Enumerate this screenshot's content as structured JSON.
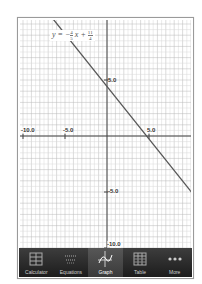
{
  "graph": {
    "equation": {
      "lhs": "y =",
      "sign": "−",
      "slope_num": "4",
      "slope_den": "5",
      "var": "x",
      "plus": "+",
      "intercept_num": "11",
      "intercept_den": "4"
    },
    "x_labels": [
      {
        "text": "-10.0",
        "value": -10
      },
      {
        "text": "-5.0",
        "value": -5
      },
      {
        "text": "5.0",
        "value": 5
      }
    ],
    "y_labels": [
      {
        "text": "5.0",
        "value": 5
      },
      {
        "text": "-5.0",
        "value": -5
      },
      {
        "text": "-10.0",
        "value": -10
      }
    ],
    "colors": {
      "line": "#555555",
      "grid_minor": "#d8d8d8",
      "grid_major": "#b8b8b8",
      "axis": "#444444"
    }
  },
  "tabbar": {
    "tabs": [
      {
        "label": "Calculator",
        "icon": "calculator-icon",
        "active": false
      },
      {
        "label": "Equations",
        "icon": "equations-icon",
        "active": false
      },
      {
        "label": "Graph",
        "icon": "graph-icon",
        "active": true
      },
      {
        "label": "Table",
        "icon": "table-icon",
        "active": false
      },
      {
        "label": "More",
        "icon": "more-icon",
        "active": false
      }
    ]
  }
}
